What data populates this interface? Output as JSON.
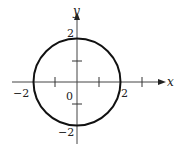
{
  "figure": {
    "equation": "x^2 + y^2 = 4",
    "axes": {
      "x_label": "x",
      "y_label": "y",
      "origin_label": "0",
      "x_tick_labels": [
        "-2",
        "2"
      ],
      "y_tick_labels": [
        "2",
        "-2"
      ],
      "x_range": [
        -2.5,
        3
      ],
      "y_range": [
        -2.8,
        2.8
      ]
    },
    "circle": {
      "center": [
        0,
        0
      ],
      "radius": 2
    },
    "colors": {
      "stroke": "#222222",
      "background": "#ffffff"
    }
  }
}
